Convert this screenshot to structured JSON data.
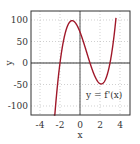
{
  "chart_data": {
    "type": "line",
    "title": "",
    "xlabel": "x",
    "ylabel": "y",
    "xlim": [
      -5,
      5
    ],
    "ylim": [
      -120,
      120
    ],
    "xticks": [
      "-4",
      "-2",
      "0",
      "2",
      "4"
    ],
    "yticks": [
      "100",
      "50",
      "0",
      "-50",
      "-100"
    ],
    "grid": true,
    "annotation": "y = f'(x)",
    "series": [
      {
        "name": "y = f'(x)",
        "color": "#a0182a",
        "x": [
          -2.6,
          -2.4,
          -2.2,
          -2.0,
          -1.6,
          -1.2,
          -0.8,
          -0.4,
          0.0,
          0.4,
          0.8,
          1.2,
          1.6,
          2.0,
          2.1,
          2.4,
          2.8,
          3.2,
          3.6
        ],
        "y": [
          -121,
          -78,
          -37,
          0,
          54,
          87,
          98,
          94,
          72,
          42,
          12,
          -14,
          -35,
          -48,
          -48,
          -44,
          -17,
          30,
          101
        ]
      }
    ]
  }
}
